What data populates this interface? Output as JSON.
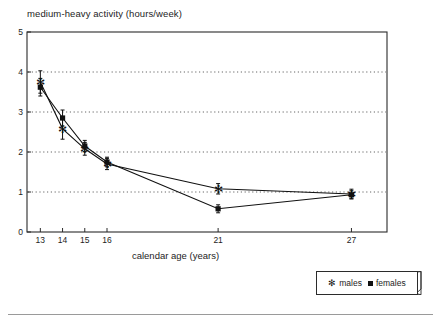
{
  "chart_data": {
    "type": "line",
    "title": "medium-heavy activity  (hours/week)",
    "xlabel": "calendar age (years)",
    "ylabel": "",
    "x": [
      13,
      14,
      15,
      16,
      21,
      27
    ],
    "xtick_labels": [
      "13",
      "14",
      "15",
      "16",
      "21",
      "27"
    ],
    "ytick_labels": [
      "0",
      "1",
      "2",
      "3",
      "4",
      "5"
    ],
    "xlim": [
      12.4,
      28.6
    ],
    "ylim": [
      0,
      5
    ],
    "grid": "horizontal dotted gridlines at y = 1, 2, 3, 4",
    "legend_position": "below plot, right",
    "series": [
      {
        "name": "males",
        "marker": "asterisk",
        "values": [
          3.75,
          2.58,
          2.08,
          1.7,
          1.08,
          0.95
        ],
        "error_bars": [
          0.28,
          0.26,
          0.16,
          0.14,
          0.13,
          0.12
        ]
      },
      {
        "name": "females",
        "marker": "filled-square",
        "values": [
          3.62,
          2.85,
          2.15,
          1.75,
          0.58,
          0.93
        ],
        "error_bars": [
          0.22,
          0.2,
          0.14,
          0.12,
          0.1,
          0.1
        ]
      }
    ]
  },
  "legend": {
    "males_label": "males",
    "females_label": "females",
    "males_marker_glyph": "✻",
    "females_marker_glyph": "■"
  },
  "colors": {
    "line": "#111111",
    "axis": "#2b2b2b",
    "grid": "#555555",
    "text": "#1d1d1d",
    "background": "#ffffff"
  }
}
